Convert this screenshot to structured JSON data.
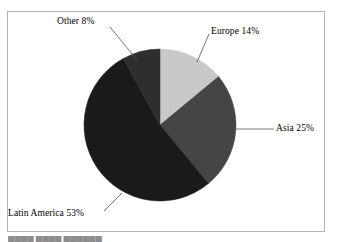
{
  "figure": {
    "name": "pie-chart-figure",
    "background_color": "#ffffff",
    "frame_color": "#b4b4b4",
    "bottom_cut_text": "████ ████ ██████"
  },
  "chart_data": {
    "type": "pie",
    "title": "",
    "subtitle": "",
    "xlabel": "",
    "ylabel": "",
    "legend_position": "none",
    "grid": false,
    "labels_position": "outside-with-leader-lines",
    "start_angle_deg": 0,
    "direction": "clockwise",
    "center": {
      "x": 160,
      "y": 125
    },
    "radius": 76,
    "categories": [
      "Europe",
      "Asia",
      "Latin America",
      "Other"
    ],
    "values": [
      14,
      25,
      53,
      8
    ],
    "value_unit": "%",
    "slices": [
      {
        "name": "Europe",
        "value": 14,
        "label": "Europe 14%",
        "color": "#c9c9c9",
        "start_angle_deg": 0,
        "end_angle_deg": 50.4,
        "leader_line": {
          "x1": 197,
          "y1": 62,
          "x2": 209,
          "y2": 34
        }
      },
      {
        "name": "Asia",
        "value": 25,
        "label": "Asia 25%",
        "color": "#454545",
        "start_angle_deg": 50.4,
        "end_angle_deg": 140.4,
        "leader_line": {
          "x1": 236,
          "y1": 129,
          "x2": 274,
          "y2": 129
        }
      },
      {
        "name": "Latin America",
        "value": 53,
        "label": "Latin America 53%",
        "color": "#1a1a1a",
        "start_angle_deg": 140.4,
        "end_angle_deg": 331.2,
        "leader_line": {
          "x1": 122,
          "y1": 193,
          "x2": 104,
          "y2": 211
        }
      },
      {
        "name": "Other",
        "value": 8,
        "label": "Other 8%",
        "color": "#2e2e2e",
        "start_angle_deg": 331.2,
        "end_angle_deg": 360,
        "leader_line": {
          "x1": 137,
          "y1": 60,
          "x2": 110,
          "y2": 27
        }
      }
    ]
  },
  "labels": {
    "other": "Other 8%",
    "europe": "Europe 14%",
    "asia": "Asia 25%",
    "latin_america": "Latin America 53%"
  }
}
